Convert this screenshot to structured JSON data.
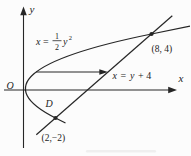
{
  "labels": {
    "y_axis": "y",
    "x_axis": "x",
    "origin": "O",
    "parabola_eq": {
      "x": "x",
      "equals": "=",
      "numerator": "1",
      "denominator": "2",
      "y": "y",
      "exponent": "2"
    },
    "line_eq": {
      "x": "x",
      "equals": "=",
      "y": "y",
      "plus_four": "+ 4"
    },
    "point_upper": "(8, 4)",
    "point_lower_name": "D",
    "point_lower_coords": "(2,−2)"
  },
  "figure": {
    "type": "math-graph",
    "curves": [
      {
        "name": "parabola",
        "equation": "x = (1/2)y²",
        "opens": "right",
        "vertex": [
          0,
          0
        ]
      },
      {
        "name": "line",
        "equation": "x = y + 4"
      }
    ],
    "marked_points": [
      {
        "name": "upper-intersection",
        "coords": [
          8,
          4
        ]
      },
      {
        "name": "lower-intersection",
        "label": "D",
        "coords": [
          2,
          -2
        ]
      }
    ],
    "annotations": [
      "horizontal-element-arrow from parabola to line"
    ]
  },
  "colors": {
    "background": "#fcfcfc",
    "ink": "#262626",
    "text": "#1d1d1d"
  }
}
